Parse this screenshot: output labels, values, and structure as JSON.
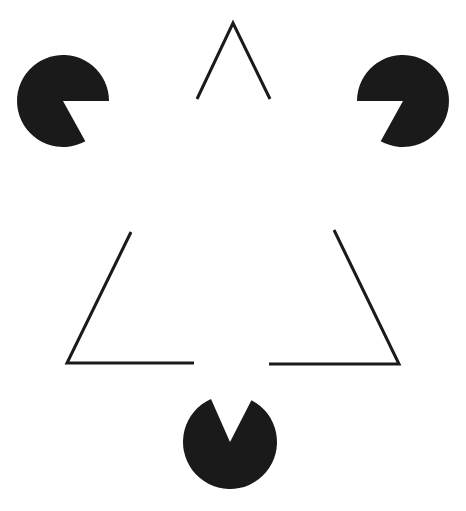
{
  "figure": {
    "width": 466,
    "height": 511,
    "background": "#ffffff",
    "ink": "#1a1a1a",
    "stroke_width": 3,
    "pacmen": [
      {
        "name": "left-pacman",
        "cx": 63,
        "cy": 101,
        "r": 46,
        "mouth": [
          [
            109,
            101
          ],
          [
            88,
            146
          ]
        ]
      },
      {
        "name": "right-pacman",
        "cx": 403,
        "cy": 101,
        "r": 46,
        "mouth": [
          [
            357,
            101
          ],
          [
            378,
            146
          ]
        ]
      },
      {
        "name": "bottom-pacman",
        "cx": 230,
        "cy": 442,
        "r": 47,
        "mouth": [
          [
            211,
            399
          ],
          [
            252,
            399
          ]
        ]
      }
    ],
    "outline_segments": [
      {
        "name": "top-apex",
        "points": "197,99 233,23 270,99"
      },
      {
        "name": "bottom-left-corner",
        "points": "131,232 67,363 194,363"
      },
      {
        "name": "bottom-right-corner",
        "points": "334,230 399,364 269,364"
      }
    ]
  }
}
